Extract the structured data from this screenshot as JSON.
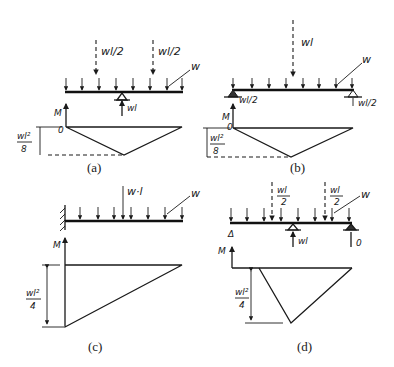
{
  "figure": {
    "panels": [
      {
        "id": "a",
        "caption": "(a)",
        "loads": {
          "point_left": "wl/2",
          "point_right": "wl/2",
          "distributed": "w"
        },
        "reactions": {
          "center": "wl"
        },
        "moment_axis": "M",
        "origin_label": "0",
        "max_moment": "wl²/8",
        "max_moment_num": "wl²",
        "max_moment_den": "8"
      },
      {
        "id": "b",
        "caption": "(b)",
        "loads": {
          "point_center": "wl",
          "distributed": "w"
        },
        "reactions": {
          "left": "wl/2",
          "right": "wl/2"
        },
        "moment_axis": "M",
        "origin_label": "0",
        "max_moment": "wl²/8",
        "max_moment_num": "wl²",
        "max_moment_den": "8"
      },
      {
        "id": "c",
        "caption": "(c)",
        "loads": {
          "point_center": "w·l",
          "distributed": "w"
        },
        "support": "fixed wall",
        "moment_axis": "M",
        "max_moment": "wl²/4",
        "max_moment_num": "wl²",
        "max_moment_den": "4"
      },
      {
        "id": "d",
        "caption": "(d)",
        "loads": {
          "point_left": "wl/2",
          "point_right": "wl/2",
          "distributed": "w"
        },
        "reactions": {
          "middle": "wl",
          "right": "0"
        },
        "free_end_marker": "Δ",
        "moment_axis": "M",
        "max_moment": "wl²/4",
        "max_moment_num": "wl²",
        "max_moment_den": "4"
      }
    ],
    "labels": {
      "frac_wl": "wl",
      "frac_2": "2",
      "slash_half": "/2"
    }
  }
}
